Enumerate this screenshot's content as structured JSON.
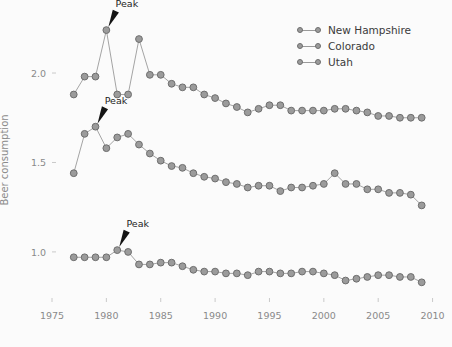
{
  "chart_data": {
    "type": "line",
    "title": "",
    "xlabel": "",
    "ylabel": "Beer consumption",
    "xlim": [
      1975.0,
      2010.5
    ],
    "ylim": [
      0.72,
      2.33
    ],
    "xticks": [
      1975,
      1980,
      1985,
      1990,
      1995,
      2000,
      2005,
      2010
    ],
    "xticklabels": [
      "1975",
      "1980",
      "1985",
      "1990",
      "1995",
      "2000",
      "2005",
      "2010"
    ],
    "yticks": [
      1.0,
      1.5,
      2.0
    ],
    "yticklabels": [
      "1.0",
      "1.5",
      "2.0"
    ],
    "grid": false,
    "legend_position": "upper right",
    "marker": "circle",
    "marker_color": "#9b9b9b",
    "marker_edge_color": "#6e6e6e",
    "line_color": "#9a9a9a",
    "background_color": "#fbfbfb",
    "x": [
      1977,
      1978,
      1979,
      1980,
      1981,
      1982,
      1983,
      1984,
      1985,
      1986,
      1987,
      1988,
      1989,
      1990,
      1991,
      1992,
      1993,
      1994,
      1995,
      1996,
      1997,
      1998,
      1999,
      2000,
      2001,
      2002,
      2003,
      2004,
      2005,
      2006,
      2007,
      2008,
      2009
    ],
    "series": [
      {
        "name": "New Hampshire",
        "values": [
          1.88,
          1.98,
          1.98,
          2.24,
          1.88,
          1.88,
          2.19,
          1.99,
          1.99,
          1.94,
          1.92,
          1.92,
          1.88,
          1.86,
          1.83,
          1.81,
          1.78,
          1.8,
          1.82,
          1.82,
          1.79,
          1.79,
          1.79,
          1.79,
          1.8,
          1.8,
          1.79,
          1.78,
          1.76,
          1.76,
          1.75,
          1.75,
          1.75
        ],
        "peak": {
          "x": 1980,
          "y": 2.24,
          "label": "Peak"
        }
      },
      {
        "name": "Colorado",
        "values": [
          1.44,
          1.66,
          1.7,
          1.58,
          1.64,
          1.66,
          1.6,
          1.55,
          1.51,
          1.48,
          1.47,
          1.44,
          1.42,
          1.41,
          1.39,
          1.38,
          1.36,
          1.37,
          1.37,
          1.34,
          1.36,
          1.36,
          1.37,
          1.38,
          1.44,
          1.38,
          1.38,
          1.35,
          1.35,
          1.33,
          1.33,
          1.32,
          1.26
        ],
        "peak": {
          "x": 1979,
          "y": 1.7,
          "label": "Peak"
        }
      },
      {
        "name": "Utah",
        "values": [
          0.97,
          0.97,
          0.97,
          0.97,
          1.01,
          1.0,
          0.93,
          0.93,
          0.94,
          0.94,
          0.92,
          0.9,
          0.89,
          0.89,
          0.88,
          0.88,
          0.87,
          0.89,
          0.89,
          0.88,
          0.88,
          0.89,
          0.89,
          0.88,
          0.87,
          0.84,
          0.85,
          0.86,
          0.87,
          0.87,
          0.86,
          0.86,
          0.83
        ],
        "peak": {
          "x": 1981,
          "y": 1.01,
          "label": "Peak"
        }
      }
    ]
  },
  "legend": {
    "items": [
      {
        "label": "New Hampshire"
      },
      {
        "label": "Colorado"
      },
      {
        "label": "Utah"
      }
    ]
  }
}
